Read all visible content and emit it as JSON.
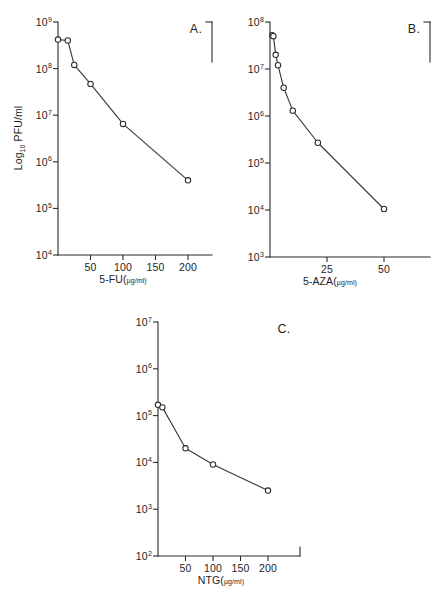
{
  "figure": {
    "background_color": "#ffffff",
    "ink_color": "#2b2b2b",
    "marker_fill": "#ffffff"
  },
  "chart_data": [
    {
      "type": "line",
      "panel_label": "A.",
      "title": "",
      "xlabel": "5-FU(µg/ml)",
      "xlabel_parts": {
        "head": "5-FU(",
        "unit": "µg/ml)"
      },
      "ylabel": "Log10 PFU/ml",
      "ylabel_parts": {
        "head": "Log",
        "sub": "10",
        "tail": " PFU/ml"
      },
      "xlim": [
        0,
        250
      ],
      "ylim": [
        10000,
        1000000000
      ],
      "yscale": "log",
      "grid": false,
      "legend": "none",
      "xticks": [
        50,
        100,
        150,
        200
      ],
      "xticklabels": [
        "50",
        "100",
        "150",
        "200"
      ],
      "yticks": [
        10000,
        100000,
        1000000,
        10000000,
        100000000,
        1000000000
      ],
      "yticklabels": [
        "10⁴",
        "10⁵",
        "10⁶",
        "10⁷",
        "10⁸",
        "10⁹"
      ],
      "ytick_bases": [
        "10",
        "10",
        "10",
        "10",
        "10",
        "10"
      ],
      "ytick_exponents": [
        "4",
        "5",
        "6",
        "7",
        "8",
        "9"
      ],
      "x": [
        0,
        15,
        25,
        50,
        100,
        200
      ],
      "y": [
        420000000,
        400000000,
        120000000,
        47000000,
        6500000,
        400000
      ],
      "marker": "open-circle",
      "n_points": 6
    },
    {
      "type": "line",
      "panel_label": "B.",
      "title": "",
      "xlabel": "5-AZA(µg/ml)",
      "xlabel_parts": {
        "head": "5-AZA(",
        "unit": "µg/ml)"
      },
      "ylabel": "",
      "xlim": [
        0,
        62
      ],
      "ylim": [
        1000,
        100000000
      ],
      "yscale": "log",
      "grid": false,
      "legend": "none",
      "xticks": [
        25,
        50
      ],
      "xticklabels": [
        "25",
        "50"
      ],
      "yticks": [
        1000,
        10000,
        100000,
        1000000,
        10000000,
        100000000
      ],
      "yticklabels": [
        "10³",
        "10⁴",
        "10⁵",
        "10⁶",
        "10⁷",
        "10⁸"
      ],
      "ytick_bases": [
        "10",
        "10",
        "10",
        "10",
        "10",
        "10"
      ],
      "ytick_exponents": [
        "3",
        "4",
        "5",
        "6",
        "7",
        "8"
      ],
      "x": [
        1,
        1.5,
        2.5,
        3.5,
        6,
        10,
        21,
        50
      ],
      "y": [
        52000000,
        50000000,
        20000000,
        12000000,
        4000000,
        1300000,
        270000,
        10500
      ],
      "marker": "open-circle",
      "n_points": 8
    },
    {
      "type": "line",
      "panel_label": "C.",
      "title": "",
      "xlabel": "NTG(µg/ml)",
      "xlabel_parts": {
        "head": "NTG(",
        "unit": "µg/ml)"
      },
      "ylabel": "",
      "xlim": [
        0,
        250
      ],
      "ylim": [
        100,
        10000000
      ],
      "yscale": "log",
      "grid": false,
      "legend": "none",
      "xticks": [
        50,
        100,
        150,
        200
      ],
      "xticklabels": [
        "50",
        "100",
        "150",
        "200"
      ],
      "yticks": [
        100,
        1000,
        10000,
        100000,
        1000000,
        10000000
      ],
      "yticklabels": [
        "10²",
        "10³",
        "10⁴",
        "10⁵",
        "10⁶",
        "10⁷"
      ],
      "ytick_bases": [
        "10",
        "10",
        "10",
        "10",
        "10",
        "10"
      ],
      "ytick_exponents": [
        "2",
        "3",
        "4",
        "5",
        "6",
        "7"
      ],
      "x": [
        0,
        8,
        50,
        100,
        200
      ],
      "y": [
        170000,
        150000,
        20000,
        9000,
        2500
      ],
      "marker": "open-circle",
      "n_points": 5
    }
  ]
}
